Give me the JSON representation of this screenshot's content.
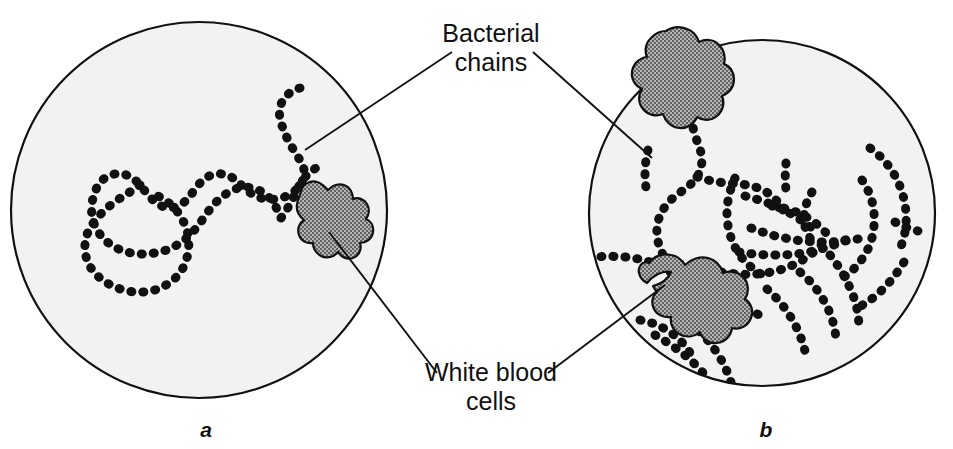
{
  "figure": {
    "type": "microscopy-illustration",
    "panels": [
      {
        "id": "a",
        "label": "a",
        "description": "Low density of bacterial chains with one white blood cell",
        "circle": {
          "cx": 199,
          "cy": 210,
          "r": 188
        },
        "white_blood_cells": 1,
        "bacterial_chain_count": 1
      },
      {
        "id": "b",
        "label": "b",
        "description": "High density of bacterial chains with two white blood cells",
        "circle": {
          "cx": 762,
          "cy": 213,
          "r": 173
        },
        "white_blood_cells": 2,
        "bacterial_chain_count": 14
      }
    ],
    "annotations": [
      {
        "name": "bacterial-chains",
        "line1": "Bacterial",
        "line2": "chains",
        "text_x": 491,
        "text_y1": 42,
        "text_y2": 71,
        "leaders": [
          {
            "x1": 452,
            "y1": 52,
            "x2": 305,
            "y2": 150
          },
          {
            "x1": 533,
            "y1": 52,
            "x2": 652,
            "y2": 158
          }
        ]
      },
      {
        "name": "white-blood-cells",
        "line1": "White blood",
        "line2": "cells",
        "text_x": 491,
        "text_y1": 381,
        "text_y2": 410,
        "leaders": [
          {
            "x1": 437,
            "y1": 373,
            "x2": 329,
            "y2": 232
          },
          {
            "x1": 548,
            "y1": 373,
            "x2": 665,
            "y2": 285
          }
        ]
      }
    ],
    "colors": {
      "field_fill": "#f2f2f2",
      "field_stroke": "#111111",
      "cell_fill": "#9a9a9a",
      "cell_stroke": "#111111",
      "bacteria": "#111111",
      "text": "#111111",
      "leader": "#111111"
    }
  },
  "chart_data": {
    "type": "diagram",
    "title": "",
    "legend": [
      "Bacterial chains",
      "White blood cells"
    ],
    "panels": [
      "a",
      "b"
    ],
    "series": [
      {
        "name": "Bacterial chains",
        "values": [
          1,
          14
        ]
      },
      {
        "name": "White blood cells",
        "values": [
          1,
          2
        ]
      }
    ],
    "categories": [
      "a",
      "b"
    ]
  },
  "geometry": {
    "panel_a": {
      "chains": [
        "M 300 88 C 286 92 277 104 280 118 C 283 133 292 148 300 160 C 309 173 302 186 292 193 C 282 200 268 201 258 197 C 248 193 243 186 237 181 C 230 175 221 172 212 175 C 202 178 196 188 190 196 C 183 205 174 210 164 207 C 153 203 147 193 140 185 C 132 176 122 171 111 175 C 99 179 94 191 92 203 C 90 217 95 230 104 239 C 114 249 128 254 142 254 C 157 254 170 250 180 243 C 191 236 198 226 205 216 C 213 204 222 195 233 190 C 244 185 255 187 264 193 C 273 199 277 209 281 218",
        "M 140 185 C 131 192 121 197 112 204 C 102 212 93 221 88 232 C 83 244 84 257 91 268 C 99 280 113 288 128 291 C 143 294 158 291 169 283 C 180 276 186 265 188 253 C 190 241 188 229 182 219 C 177 209 168 201 158 196",
        "M 281 218 C 287 210 292 201 296 192 C 301 181 308 172 318 167"
      ],
      "cell": "M 301 191 C 303 184 310 180 317 182 C 322 183 325 187 328 190 C 332 186 338 183 344 185 C 350 187 353 193 353 199 C 358 197 364 199 367 204 C 370 209 369 215 366 219 C 371 221 374 226 373 232 C 372 239 366 243 360 243 C 362 249 359 256 353 258 C 347 260 341 257 338 252 C 334 257 327 259 321 256 C 316 253 313 248 313 243 C 307 244 301 241 299 235 C 297 229 299 223 304 220 C 299 216 296 210 297 204 C 298 197 301 193 301 191 Z"
    },
    "panel_b": {
      "chains": [
        "M 706 84 C 698 92 693 102 692 113 C 691 125 695 136 699 146 C 703 157 703 168 697 177 C 691 186 681 191 673 198 C 664 206 658 216 657 228 C 656 241 661 253 668 263 C 676 274 687 282 695 292",
        "M 648 150 C 646 158 645 166 645 174 C 645 182 646 190 648 197",
        "M 697 177 C 706 180 716 182 726 183 C 737 184 748 184 758 188 C 769 192 778 200 783 210",
        "M 589 258 C 601 256 613 256 625 257 C 637 258 649 261 660 266 C 671 271 680 279 687 288",
        "M 735 178 C 730 189 727 201 727 213 C 727 226 730 238 736 249 C 742 260 751 268 761 274",
        "M 745 196 C 757 199 769 203 780 208 C 792 214 803 221 813 229",
        "M 786 163 C 785 172 785 181 786 190",
        "M 812 192 C 807 200 804 209 804 218 C 804 228 808 237 815 244",
        "M 772 206 C 782 207 792 210 801 214 C 811 219 820 226 827 234",
        "M 751 228 C 762 232 773 236 785 238 C 798 241 811 242 824 242 C 837 242 850 241 862 238",
        "M 739 252 C 751 254 763 255 775 255 C 788 255 801 254 813 251 C 826 248 838 244 849 238",
        "M 721 272 C 733 274 745 275 757 274 C 770 273 782 270 793 265 C 804 260 814 253 822 244",
        "M 700 300 C 711 299 722 300 733 303 C 744 306 754 311 763 318",
        "M 670 310 C 681 316 691 323 700 332 C 710 342 718 353 724 365 C 730 377 734 390 735 403",
        "M 640 320 C 651 322 661 326 670 332 C 680 339 688 348 693 358",
        "M 870 148 C 880 155 888 164 894 174 C 901 186 905 199 906 213 C 907 227 904 241 898 253",
        "M 862 180 C 869 190 873 201 874 213 C 875 226 873 238 868 249 C 862 261 854 270 844 277",
        "M 895 222 C 902 226 910 229 918 231",
        "M 830 255 C 838 265 845 276 850 288 C 856 301 859 315 859 329",
        "M 800 272 C 810 280 818 290 824 301 C 831 313 835 326 836 339",
        "M 767 289 C 776 297 784 306 790 316 C 797 327 802 339 805 351",
        "M 655 335 C 664 340 673 346 681 352 C 690 359 698 367 705 375",
        "M 629 345 C 637 353 644 362 650 371 C 657 381 662 392 666 403",
        "M 904 262 C 898 272 891 281 883 289 C 874 298 864 305 853 310"
      ],
      "cells": [
        "M 666 31 C 672 27 680 26 687 29 C 693 31 697 36 699 42 C 705 39 713 39 718 44 C 724 49 726 57 724 64 C 730 66 734 72 734 79 C 734 87 729 93 722 96 C 725 103 723 111 717 116 C 711 121 703 121 697 117 C 694 124 687 129 679 128 C 671 127 665 121 663 114 C 656 117 648 115 643 109 C 638 103 638 95 642 89 C 635 86 631 79 632 72 C 633 64 639 58 647 57 C 644 50 646 42 652 37 C 656 33 661 31 666 31 Z",
        "M 649 263 C 654 256 663 253 671 255 C 677 256 682 260 685 265 C 691 259 700 256 708 258 C 716 260 721 266 723 273 C 730 270 739 272 744 278 C 749 284 749 293 745 299 C 751 303 754 311 751 318 C 748 326 740 330 732 328 C 731 336 725 342 717 343 C 709 344 702 339 700 332 C 694 337 686 338 679 334 C 673 330 670 324 671 317 C 664 318 657 315 654 309 C 651 303 652 296 657 292 C 655 290 654 288 653 286 C 661 284 668 279 671 272 C 667 271 662 272 658 274 C 654 276 650 279 647 283 C 643 281 640 277 639 273 C 638 269 640 265 643 263 C 645 262 647 262 649 263 Z"
      ]
    }
  }
}
